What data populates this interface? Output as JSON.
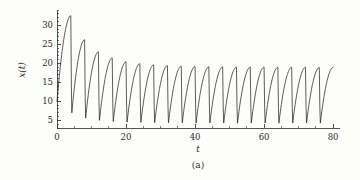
{
  "figure": {
    "caption": "(a)",
    "background_color": "#fdfdfc",
    "line_color": "#262626",
    "axis_color": "#2b2b2b"
  },
  "chart_data": {
    "type": "line",
    "title": "",
    "subtitle": "",
    "xlabel": "t",
    "ylabel": "x(t)",
    "caption": "(a)",
    "xlim": [
      0,
      82
    ],
    "ylim": [
      3,
      34
    ],
    "grid": false,
    "legend": null,
    "x_ticks_major": [
      0,
      20,
      40,
      60,
      80
    ],
    "x_tick_labels": [
      "0",
      "20",
      "40",
      "60",
      "80"
    ],
    "x_minor_tick_step": 5,
    "y_ticks_major": [
      5,
      10,
      15,
      20,
      25,
      30
    ],
    "y_tick_labels": [
      "5",
      "10",
      "15",
      "20",
      "25",
      "30"
    ],
    "y_minor_tick_step": 1,
    "series": [
      {
        "name": "x(t)",
        "color": "#262626",
        "initial_value": 10.0,
        "period": 4.0,
        "peaks": [
          32.5,
          26.2,
          23.0,
          21.4,
          20.4,
          19.9,
          19.6,
          19.4,
          19.25,
          19.15,
          19.1,
          19.05,
          19.0,
          19.0,
          19.0,
          18.95,
          18.95,
          18.95,
          18.9,
          18.9
        ],
        "peak_times": [
          4.0,
          8.0,
          12.0,
          16.0,
          20.0,
          24.0,
          28.0,
          32.0,
          36.0,
          40.0,
          44.0,
          48.0,
          52.0,
          56.0,
          60.0,
          64.0,
          68.0,
          72.0,
          76.0,
          80.0
        ],
        "troughs": [
          7.0,
          5.6,
          5.0,
          4.7,
          4.55,
          4.45,
          4.4,
          4.38,
          4.35,
          4.33,
          4.32,
          4.31,
          4.3,
          4.3,
          4.3,
          4.3,
          4.3,
          4.3,
          4.3
        ],
        "trough_times": [
          4.3,
          8.3,
          12.3,
          16.3,
          20.3,
          24.3,
          28.3,
          32.3,
          36.3,
          40.3,
          44.3,
          48.3,
          52.3,
          56.3,
          60.3,
          64.3,
          68.3,
          72.3,
          76.3
        ],
        "steady_state_peak": 18.9,
        "steady_state_trough": 4.3
      }
    ]
  }
}
